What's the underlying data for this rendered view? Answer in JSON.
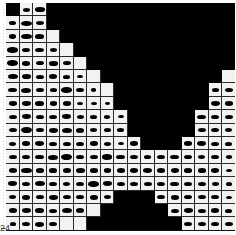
{
  "figure": {
    "kind": "grayscale-band-grid",
    "background_color": "#ffffff",
    "plot_background_color": "#000000",
    "cell_color": "#f2f2f2",
    "blob_color": "#000000",
    "gridline_color": "#2a2a2a",
    "axis_color": "#111111"
  },
  "axis": {
    "bottom_tick_label": "24",
    "tick_label_color": "#3a3a3a"
  },
  "chart_data": {
    "type": "heatmap",
    "title": "",
    "xlabel": "",
    "ylabel": "",
    "grid": true,
    "legend": "none",
    "columns": 17,
    "rows": 17,
    "cell_width": 13.5,
    "cell_height": 13.4,
    "x": [
      1,
      2,
      3,
      4,
      5,
      6,
      7,
      8,
      9,
      10,
      11,
      12,
      13,
      14,
      15,
      16,
      17
    ],
    "y": [
      1,
      2,
      3,
      4,
      5,
      6,
      7,
      8,
      9,
      10,
      11,
      12,
      13,
      14,
      15,
      16,
      17
    ],
    "top_profile_row_start": [
      1,
      0,
      0,
      2,
      3,
      4,
      5,
      6,
      8,
      10,
      11,
      11,
      11,
      10,
      8,
      6,
      5,
      6
    ],
    "bottom_profile_row_end": [
      17,
      17,
      17,
      17,
      17,
      17,
      16,
      15,
      14,
      14,
      14,
      15,
      16,
      17,
      17,
      17,
      17,
      17
    ],
    "blob_width_frac": [
      [
        0.0,
        0.55,
        0.72,
        0.0,
        0.0,
        0.0,
        0.0,
        0.0,
        0.0,
        0.0,
        0.0,
        0.0,
        0.0,
        0.0,
        0.0,
        0.0,
        0.0
      ],
      [
        0.5,
        0.8,
        0.62,
        0.0,
        0.0,
        0.0,
        0.0,
        0.0,
        0.0,
        0.0,
        0.0,
        0.0,
        0.0,
        0.0,
        0.0,
        0.0,
        0.0
      ],
      [
        0.55,
        0.82,
        0.7,
        0.0,
        0.0,
        0.0,
        0.0,
        0.0,
        0.0,
        0.0,
        0.0,
        0.0,
        0.0,
        0.0,
        0.0,
        0.0,
        0.0
      ],
      [
        0.78,
        0.58,
        0.66,
        0.55,
        0.0,
        0.0,
        0.0,
        0.0,
        0.0,
        0.0,
        0.0,
        0.0,
        0.0,
        0.0,
        0.0,
        0.0,
        0.0
      ],
      [
        0.8,
        0.62,
        0.6,
        0.68,
        0.58,
        0.0,
        0.0,
        0.0,
        0.0,
        0.0,
        0.0,
        0.0,
        0.0,
        0.0,
        0.0,
        0.0,
        0.0
      ],
      [
        0.72,
        0.7,
        0.56,
        0.62,
        0.5,
        0.45,
        0.0,
        0.0,
        0.0,
        0.0,
        0.0,
        0.0,
        0.0,
        0.0,
        0.0,
        0.0,
        0.0
      ],
      [
        0.66,
        0.72,
        0.58,
        0.52,
        0.78,
        0.6,
        0.4,
        0.0,
        0.0,
        0.0,
        0.0,
        0.0,
        0.0,
        0.0,
        0.0,
        0.52,
        0.6
      ],
      [
        0.58,
        0.66,
        0.64,
        0.55,
        0.62,
        0.48,
        0.42,
        0.38,
        0.0,
        0.0,
        0.0,
        0.45,
        0.58,
        0.7,
        0.72,
        0.66,
        0.62
      ],
      [
        0.62,
        0.7,
        0.6,
        0.58,
        0.66,
        0.55,
        0.5,
        0.46,
        0.42,
        0.55,
        0.62,
        0.68,
        0.74,
        0.7,
        0.64,
        0.6,
        0.58
      ],
      [
        0.6,
        0.82,
        0.58,
        0.66,
        0.72,
        0.62,
        0.55,
        0.52,
        0.5,
        0.58,
        0.66,
        0.72,
        0.78,
        0.66,
        0.6,
        0.56,
        0.54
      ],
      [
        0.55,
        0.62,
        0.7,
        0.6,
        0.56,
        0.58,
        0.62,
        0.55,
        0.48,
        0.62,
        0.7,
        0.64,
        0.58,
        0.62,
        0.66,
        0.58,
        0.5
      ],
      [
        0.62,
        0.58,
        0.66,
        0.72,
        0.8,
        0.62,
        0.58,
        0.74,
        0.68,
        0.56,
        0.52,
        0.6,
        0.66,
        0.58,
        0.54,
        0.62,
        0.46
      ],
      [
        0.58,
        0.78,
        0.6,
        0.56,
        0.62,
        0.68,
        0.6,
        0.55,
        0.62,
        0.58,
        0.66,
        0.62,
        0.58,
        0.6,
        0.56,
        0.58,
        0.44
      ],
      [
        0.66,
        0.6,
        0.72,
        0.58,
        0.55,
        0.62,
        0.78,
        0.66,
        0.58,
        0.62,
        0.56,
        0.6,
        0.64,
        0.58,
        0.62,
        0.54,
        0.48
      ],
      [
        0.55,
        0.62,
        0.58,
        0.66,
        0.6,
        0.58,
        0.62,
        0.55,
        0.0,
        0.0,
        0.0,
        0.58,
        0.62,
        0.56,
        0.6,
        0.58,
        0.42
      ],
      [
        0.62,
        0.7,
        0.64,
        0.6,
        0.72,
        0.62,
        0.0,
        0.0,
        0.0,
        0.0,
        0.0,
        0.0,
        0.58,
        0.66,
        0.6,
        0.62,
        0.5
      ],
      [
        0.48,
        0.62,
        0.7,
        0.58,
        0.0,
        0.0,
        0.0,
        0.0,
        0.0,
        0.0,
        0.0,
        0.0,
        0.0,
        0.62,
        0.56,
        0.58,
        0.6
      ]
    ],
    "blob_height_frac": [
      [
        0.0,
        0.3,
        0.34,
        0.0,
        0.0,
        0.0,
        0.0,
        0.0,
        0.0,
        0.0,
        0.0,
        0.0,
        0.0,
        0.0,
        0.0,
        0.0,
        0.0
      ],
      [
        0.32,
        0.38,
        0.3,
        0.0,
        0.0,
        0.0,
        0.0,
        0.0,
        0.0,
        0.0,
        0.0,
        0.0,
        0.0,
        0.0,
        0.0,
        0.0,
        0.0
      ],
      [
        0.34,
        0.4,
        0.32,
        0.0,
        0.0,
        0.0,
        0.0,
        0.0,
        0.0,
        0.0,
        0.0,
        0.0,
        0.0,
        0.0,
        0.0,
        0.0,
        0.0
      ],
      [
        0.4,
        0.32,
        0.34,
        0.3,
        0.0,
        0.0,
        0.0,
        0.0,
        0.0,
        0.0,
        0.0,
        0.0,
        0.0,
        0.0,
        0.0,
        0.0,
        0.0
      ],
      [
        0.42,
        0.34,
        0.32,
        0.36,
        0.3,
        0.0,
        0.0,
        0.0,
        0.0,
        0.0,
        0.0,
        0.0,
        0.0,
        0.0,
        0.0,
        0.0,
        0.0
      ],
      [
        0.38,
        0.36,
        0.3,
        0.34,
        0.28,
        0.26,
        0.0,
        0.0,
        0.0,
        0.0,
        0.0,
        0.0,
        0.0,
        0.0,
        0.0,
        0.0,
        0.0
      ],
      [
        0.36,
        0.38,
        0.32,
        0.28,
        0.42,
        0.32,
        0.24,
        0.0,
        0.0,
        0.0,
        0.0,
        0.0,
        0.0,
        0.0,
        0.0,
        0.28,
        0.32
      ],
      [
        0.32,
        0.36,
        0.34,
        0.3,
        0.34,
        0.26,
        0.24,
        0.22,
        0.0,
        0.0,
        0.0,
        0.26,
        0.32,
        0.38,
        0.38,
        0.36,
        0.34
      ],
      [
        0.34,
        0.38,
        0.32,
        0.32,
        0.36,
        0.3,
        0.28,
        0.26,
        0.24,
        0.3,
        0.34,
        0.36,
        0.4,
        0.38,
        0.34,
        0.32,
        0.32
      ],
      [
        0.32,
        0.44,
        0.32,
        0.36,
        0.38,
        0.34,
        0.3,
        0.28,
        0.28,
        0.32,
        0.36,
        0.38,
        0.42,
        0.36,
        0.32,
        0.3,
        0.3
      ],
      [
        0.3,
        0.34,
        0.38,
        0.32,
        0.3,
        0.32,
        0.34,
        0.3,
        0.26,
        0.34,
        0.38,
        0.34,
        0.32,
        0.34,
        0.36,
        0.32,
        0.28
      ],
      [
        0.34,
        0.32,
        0.36,
        0.38,
        0.44,
        0.34,
        0.32,
        0.4,
        0.36,
        0.3,
        0.28,
        0.32,
        0.36,
        0.32,
        0.3,
        0.34,
        0.26
      ],
      [
        0.32,
        0.42,
        0.32,
        0.3,
        0.34,
        0.36,
        0.32,
        0.3,
        0.34,
        0.32,
        0.36,
        0.34,
        0.32,
        0.32,
        0.3,
        0.32,
        0.24
      ],
      [
        0.36,
        0.32,
        0.38,
        0.32,
        0.3,
        0.34,
        0.42,
        0.36,
        0.32,
        0.34,
        0.3,
        0.32,
        0.34,
        0.32,
        0.34,
        0.3,
        0.26
      ],
      [
        0.3,
        0.34,
        0.32,
        0.36,
        0.32,
        0.32,
        0.34,
        0.3,
        0.0,
        0.0,
        0.0,
        0.32,
        0.34,
        0.3,
        0.32,
        0.32,
        0.24
      ],
      [
        0.34,
        0.38,
        0.34,
        0.32,
        0.38,
        0.34,
        0.0,
        0.0,
        0.0,
        0.0,
        0.0,
        0.0,
        0.32,
        0.36,
        0.32,
        0.34,
        0.28
      ],
      [
        0.26,
        0.34,
        0.38,
        0.32,
        0.0,
        0.0,
        0.0,
        0.0,
        0.0,
        0.0,
        0.0,
        0.0,
        0.0,
        0.34,
        0.3,
        0.32,
        0.32
      ]
    ]
  }
}
